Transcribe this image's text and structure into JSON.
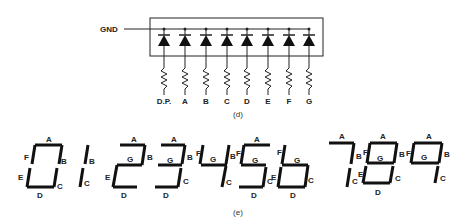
{
  "figure_d": {
    "caption": "(d)",
    "ground_label": "GND",
    "segment_inputs": [
      "D.P.",
      "A",
      "B",
      "C",
      "D",
      "E",
      "F",
      "G"
    ],
    "diode_count": 8
  },
  "figure_e": {
    "caption": "(e)",
    "digits": [
      {
        "digit": "0",
        "segments": [
          "A",
          "B",
          "C",
          "D",
          "E",
          "F"
        ]
      },
      {
        "digit": "1",
        "segments": [
          "B",
          "C"
        ]
      },
      {
        "digit": "2",
        "segments": [
          "A",
          "B",
          "G",
          "E",
          "D"
        ]
      },
      {
        "digit": "3",
        "segments": [
          "A",
          "B",
          "G",
          "C",
          "D"
        ]
      },
      {
        "digit": "4",
        "segments": [
          "F",
          "G",
          "B",
          "C"
        ]
      },
      {
        "digit": "5",
        "segments": [
          "A",
          "F",
          "G",
          "C",
          "D"
        ]
      },
      {
        "digit": "6",
        "segments": [
          "F",
          "G",
          "E",
          "C",
          "D"
        ]
      },
      {
        "digit": "7",
        "segments": [
          "A",
          "B",
          "C"
        ]
      },
      {
        "digit": "8",
        "segments": [
          "A",
          "B",
          "C",
          "D",
          "E",
          "F",
          "G"
        ]
      },
      {
        "digit": "9",
        "segments": [
          "A",
          "B",
          "F",
          "G",
          "C"
        ]
      }
    ]
  }
}
